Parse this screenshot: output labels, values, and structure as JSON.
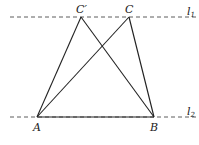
{
  "diagram": {
    "lines": [
      {
        "name": "l1",
        "label": "l",
        "subscript": "1",
        "style": "dashed"
      },
      {
        "name": "l2",
        "label": "l",
        "subscript": "2",
        "style": "dashed"
      }
    ],
    "points": {
      "A": {
        "label": "A"
      },
      "B": {
        "label": "B"
      },
      "C": {
        "label": "C"
      },
      "Cprime": {
        "label": "C′"
      }
    },
    "segments": [
      "AC′",
      "AC",
      "BC′",
      "BC",
      "AB"
    ],
    "colors": {
      "stroke": "#222222",
      "background": "#ffffff"
    }
  }
}
